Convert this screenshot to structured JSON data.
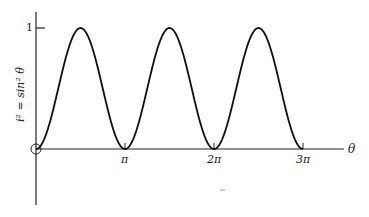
{
  "chart_data": {
    "type": "line",
    "title": "",
    "xlabel": "θ",
    "ylabel": "i² = sin² θ",
    "x_ticks": [
      "π",
      "2π",
      "3π"
    ],
    "y_ticks": [
      "1"
    ],
    "xlim": [
      0,
      3.2
    ],
    "ylim": [
      -0.6,
      1.1
    ],
    "x_units": "π",
    "grid": false,
    "legend": null,
    "series": [
      {
        "name": "sin²θ",
        "function": "sin^2(theta)",
        "x": [
          0,
          0.25,
          0.5,
          0.75,
          1,
          1.25,
          1.5,
          1.75,
          2,
          2.25,
          2.5,
          2.75,
          3
        ],
        "values": [
          0,
          0.5,
          1,
          0.5,
          0,
          0.5,
          1,
          0.5,
          0,
          0.5,
          1,
          0.5,
          0
        ]
      }
    ],
    "annotations": [
      "open circle at origin"
    ]
  },
  "labels": {
    "y_tick_1": "1",
    "x_tick_pi": "π",
    "x_tick_2pi": "2π",
    "x_tick_3pi": "3π",
    "x_axis": "θ",
    "y_axis": "i² = sin² θ"
  }
}
